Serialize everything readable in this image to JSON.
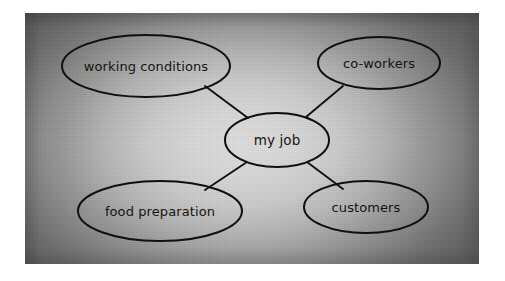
{
  "scene": {
    "kind": "photograph-of-handdrawn-mindmap",
    "paper_background_color": "#d8d8d8",
    "vignette_edge_color": "#5e5e5e",
    "ink_color": "#120f0c",
    "page_background_color": "#ffffff"
  },
  "mindmap": {
    "center": {
      "label": "my job"
    },
    "branches": [
      {
        "id": "working-conditions",
        "label": "working conditions",
        "position": "top-left"
      },
      {
        "id": "co-workers",
        "label": "co-workers",
        "position": "top-right"
      },
      {
        "id": "food-preparation",
        "label": "food preparation",
        "position": "bottom-left"
      },
      {
        "id": "customers",
        "label": "customers",
        "position": "bottom-right"
      }
    ],
    "connector_count": 4
  }
}
